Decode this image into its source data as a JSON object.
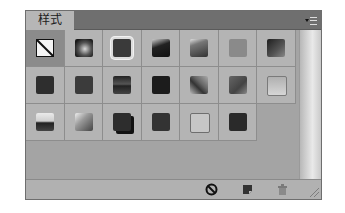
{
  "panel": {
    "tab_label": "样式",
    "menu_icon": "panel-menu-icon"
  },
  "styles": [
    {
      "name": "none",
      "selected": true
    },
    {
      "name": "style-2",
      "bg": "radial-gradient(circle at 55% 55%, #d9d9d9 0%, #555 45%, #1a1a1a 80%)"
    },
    {
      "name": "style-3",
      "bg": "#3a3a3a",
      "glow": true
    },
    {
      "name": "style-4",
      "bg": "linear-gradient(160deg,#cfcfcf 0%,#222 40%,#111 100%)"
    },
    {
      "name": "style-5",
      "bg": "linear-gradient(160deg,#e0e0e0 0%,#777 30%,#333 100%)"
    },
    {
      "name": "style-6",
      "bg": "#8a8a8a"
    },
    {
      "name": "style-7",
      "bg": "linear-gradient(135deg,#1e1e1e 0%,#555 60%,#888 100%)"
    },
    {
      "name": "style-8",
      "bg": "#2e2e2e"
    },
    {
      "name": "style-9",
      "bg": "#3b3b3b"
    },
    {
      "name": "style-10",
      "bg": "linear-gradient(to bottom,#222 0%,#555 45%,#222 55%,#444 100%)"
    },
    {
      "name": "style-11",
      "bg": "#1c1c1c",
      "pattern": true
    },
    {
      "name": "style-12",
      "bg": "linear-gradient(45deg,#bbb 0%,#333 40%,#666 60%,#aaa 100%)"
    },
    {
      "name": "style-13",
      "bg": "linear-gradient(135deg,#666 0%,#444 60%,#888 100%)"
    },
    {
      "name": "style-14",
      "bg": "linear-gradient(to bottom,#b0b0b0,#d6d6d6)",
      "border": "#7a7a7a"
    },
    {
      "name": "style-15",
      "bg": "linear-gradient(to bottom,#eaeaea 0%,#cfcfcf 45%,#222 55%,#444 100%)"
    },
    {
      "name": "style-16",
      "bg": "linear-gradient(135deg,#eee 0%,#999 40%,#444 100%)"
    },
    {
      "name": "style-17",
      "bg": "#2d2d2d",
      "shadow": true
    },
    {
      "name": "style-18",
      "bg": "#333"
    },
    {
      "name": "style-19",
      "bg": "#c6c6c6",
      "border": "#6e6e6e"
    },
    {
      "name": "style-20",
      "bg": "#2a2a2a"
    }
  ],
  "footer": {
    "icons": [
      "clear-style-icon",
      "new-style-icon",
      "delete-icon"
    ]
  }
}
